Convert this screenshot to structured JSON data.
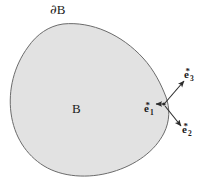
{
  "figure": {
    "canvas": {
      "width": 212,
      "height": 188
    },
    "background_color": "#ffffff"
  },
  "region": {
    "name": "body-region",
    "fill_color": "#e2e2e2",
    "stroke_color": "#6b6b6b",
    "stroke_width": 1,
    "interior_label": "B",
    "boundary_label_partial": "∂",
    "boundary_label_set": "B"
  },
  "vectors": [
    {
      "id": "e1",
      "base": "e",
      "subscript": "1",
      "superscript": "*",
      "origin": [
        163,
        104
      ],
      "tip": [
        163,
        104
      ],
      "label_position": [
        144,
        101
      ],
      "note": "basis vector label at contact point"
    },
    {
      "id": "e3",
      "base": "e",
      "subscript": "3",
      "superscript": "*",
      "origin": [
        163,
        104
      ],
      "tip": [
        185,
        79
      ],
      "label_position": [
        184,
        67
      ]
    },
    {
      "id": "e2",
      "base": "e",
      "subscript": "2",
      "superscript": "*",
      "origin": [
        163,
        104
      ],
      "tip": [
        183,
        128
      ],
      "label_position": [
        182,
        122
      ]
    }
  ],
  "colors": {
    "line": "#2b2b2b",
    "outline": "#6b6b6b",
    "fill": "#e2e2e2",
    "text": "#1a1a1a"
  }
}
